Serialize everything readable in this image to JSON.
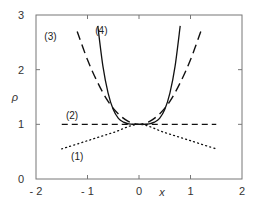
{
  "chart_data": {
    "type": "line",
    "title": "",
    "xlabel": "x",
    "ylabel": "ρ",
    "xlim": [
      -2,
      2
    ],
    "ylim": [
      0,
      3
    ],
    "xticks": [
      -2,
      -1,
      0,
      1,
      2
    ],
    "yticks": [
      0,
      1,
      2,
      3
    ],
    "xtick_labels": [
      "- 2",
      "- 1",
      "0",
      "1",
      "2"
    ],
    "ytick_labels": [
      "0",
      "1",
      "2",
      "3"
    ],
    "grid": false,
    "legend": "none (inline curve labels)",
    "series": [
      {
        "name": "(1)",
        "label": "(1)",
        "style": "dotted",
        "x": [
          -1.5,
          -1.0,
          -0.5,
          0.0,
          0.5,
          1.0,
          1.5
        ],
        "y": [
          0.55,
          0.7,
          0.85,
          1.0,
          0.85,
          0.7,
          0.55
        ]
      },
      {
        "name": "(2)",
        "label": "(2)",
        "style": "dashed",
        "x": [
          -1.5,
          1.5
        ],
        "y": [
          1.0,
          1.0
        ]
      },
      {
        "name": "(3)",
        "label": "(3)",
        "style": "long-dashed",
        "x": [
          -1.2,
          -1.0,
          -0.8,
          -0.6,
          -0.4,
          -0.2,
          0.0,
          0.2,
          0.4,
          0.6,
          0.8,
          1.0,
          1.2
        ],
        "y": [
          2.7,
          2.18,
          1.76,
          1.42,
          1.19,
          1.05,
          1.0,
          1.05,
          1.19,
          1.42,
          1.76,
          2.18,
          2.7
        ]
      },
      {
        "name": "(4)",
        "label": "(4)",
        "style": "solid",
        "x": [
          -0.8,
          -0.7,
          -0.6,
          -0.5,
          -0.4,
          -0.3,
          -0.2,
          -0.1,
          0.0,
          0.1,
          0.2,
          0.3,
          0.4,
          0.5,
          0.6,
          0.7,
          0.8
        ],
        "y": [
          2.8,
          2.06,
          1.57,
          1.27,
          1.11,
          1.04,
          1.01,
          1.0,
          1.0,
          1.0,
          1.01,
          1.04,
          1.11,
          1.27,
          1.57,
          2.06,
          2.8
        ]
      }
    ],
    "annotations": [
      {
        "text": "(1)",
        "x": -1.2,
        "y": 0.35
      },
      {
        "text": "(2)",
        "x": -1.3,
        "y": 1.1
      },
      {
        "text": "(3)",
        "x": -1.72,
        "y": 2.55
      },
      {
        "text": "(4)",
        "x": -0.73,
        "y": 2.65
      }
    ]
  }
}
